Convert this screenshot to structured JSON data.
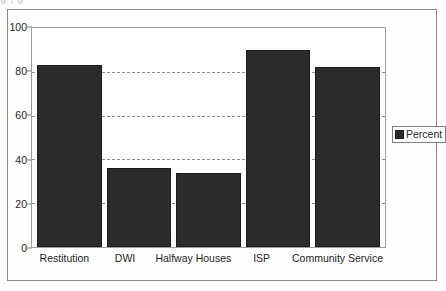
{
  "figure": {
    "background_color": "#fdfdfc",
    "frame_color": "#8a8a8a",
    "artifact_text": "g                      ,                      g"
  },
  "legend": {
    "position": "right",
    "entries": [
      {
        "label": "Percent",
        "color": "#2b2b2b",
        "swatch_name": "percent-swatch"
      }
    ]
  },
  "axis": {
    "y_ticks": [
      "0",
      "20",
      "40",
      "60",
      "80",
      "100"
    ],
    "x_ticks": [
      "Restitution",
      "DWI",
      "Halfway Houses",
      "ISP",
      "Community Service"
    ]
  },
  "chart_data": {
    "type": "bar",
    "title": "",
    "xlabel": "",
    "ylabel": "",
    "categories": [
      "Restitution",
      "DWI",
      "Halfway Houses",
      "ISP",
      "Community Service"
    ],
    "values": [
      83,
      36,
      34,
      90,
      82
    ],
    "series": [
      {
        "name": "Percent",
        "color": "#2b2b2b",
        "values": [
          83,
          36,
          34,
          90,
          82
        ]
      }
    ],
    "ylim": [
      0,
      100
    ],
    "ytick_step": 20,
    "yticks": [
      0,
      20,
      40,
      60,
      80,
      100
    ],
    "grid": true,
    "grid_axis": "y",
    "grid_style": "dashed",
    "grid_color": "#8d8d8d",
    "legend_position": "right",
    "legend_entries": [
      "Percent"
    ],
    "bar_color": "#2b2b2b",
    "plot_background": "#ffffff",
    "annotations": []
  }
}
